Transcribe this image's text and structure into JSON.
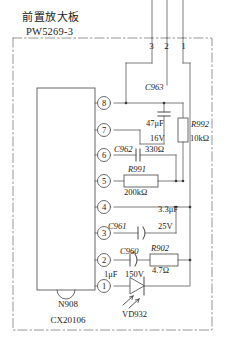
{
  "board": {
    "title_cn": "前置放大板",
    "title_code": "PW5269-3"
  },
  "connector": {
    "name": "edge-connector",
    "pins": [
      "3",
      "2",
      "1"
    ]
  },
  "ic": {
    "designator": "N908",
    "part_number": "CX20106",
    "pins": [
      "8",
      "7",
      "6",
      "5",
      "4",
      "3",
      "2",
      "1"
    ]
  },
  "components": [
    {
      "designator": "C963",
      "type": "capacitor",
      "value": "47μF",
      "rating": "16V"
    },
    {
      "designator": "R992",
      "type": "resistor",
      "value": "10kΩ",
      "rating": ""
    },
    {
      "designator": "C962",
      "type": "capacitor",
      "value": "330Ω",
      "rating": ""
    },
    {
      "designator": "R991",
      "type": "resistor",
      "value": "200kΩ",
      "rating": ""
    },
    {
      "designator": "C961",
      "type": "capacitor-polarized",
      "value": "3.3μF",
      "rating": "25V"
    },
    {
      "designator": "C960",
      "type": "capacitor-polarized",
      "value": "1μF",
      "rating": "150V"
    },
    {
      "designator": "R902",
      "type": "resistor",
      "value": "4.7Ω",
      "rating": ""
    },
    {
      "designator": "VD932",
      "type": "led",
      "value": "",
      "rating": ""
    }
  ],
  "labels": {
    "c963_ref": "C963",
    "c963_val": "47μF",
    "c963_rat": "16V",
    "r992_ref": "R992",
    "r992_val": "10kΩ",
    "c962_ref": "C962",
    "c962_val": "330Ω",
    "r991_ref": "R991",
    "r991_val": "200kΩ",
    "c961_ref": "C961",
    "c961_val": "3.3μF",
    "c961_rat": "25V",
    "c960_ref": "C960",
    "c960_val": "1μF",
    "c960_rat": "150V",
    "r902_ref": "R902",
    "r902_val": "4.7Ω",
    "vd932_ref": "VD932",
    "ic_ref": "N908",
    "ic_part": "CX20106",
    "pin8": "8",
    "pin7": "7",
    "pin6": "6",
    "pin5": "5",
    "pin4": "4",
    "pin3": "3",
    "pin2": "2",
    "pin1": "1",
    "conn3": "3",
    "conn2": "2",
    "conn1": "1"
  },
  "colors": {
    "ink": "#1a1a1a",
    "wire": "#555555",
    "background": "#ffffff"
  }
}
